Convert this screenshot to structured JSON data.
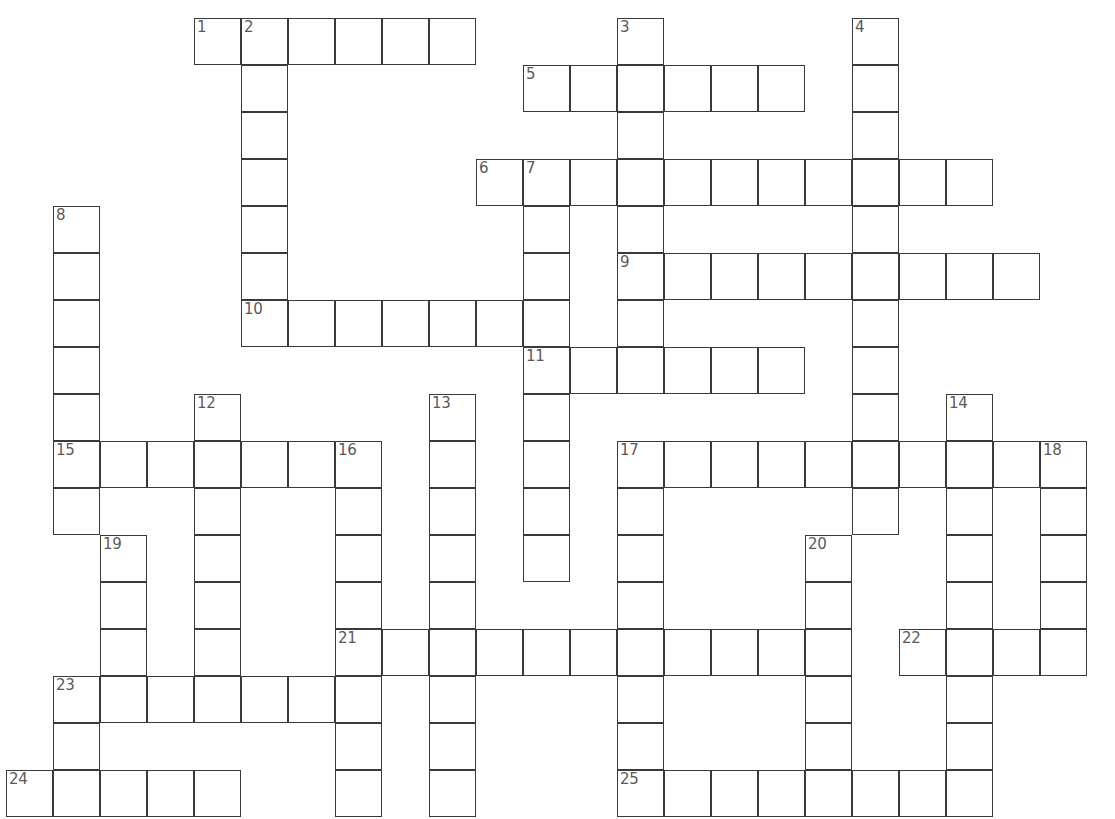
{
  "puzzle": {
    "title": "Crossword Puzzle Grid",
    "cell_size": 47,
    "origin_x": 6,
    "origin_y": 18,
    "cols": 23,
    "rows": 17,
    "colors": {
      "background": "#ffffff",
      "cell_fill": "#ffffff",
      "cell_border": "#3a3a3a",
      "number_text": "#5a5a5a"
    },
    "numbered_clue_count": 25,
    "clue_numbers": [
      1,
      2,
      3,
      4,
      5,
      6,
      7,
      8,
      9,
      10,
      11,
      12,
      13,
      14,
      15,
      16,
      17,
      18,
      19,
      20,
      21,
      22,
      23,
      24,
      25
    ],
    "entries": [
      {
        "number": "1",
        "direction": "across",
        "col": 4,
        "row": 0,
        "length": 6
      },
      {
        "number": "2",
        "direction": "down",
        "col": 5,
        "row": 0,
        "length": 7
      },
      {
        "number": "3",
        "direction": "down",
        "col": 13,
        "row": 0,
        "length": 8
      },
      {
        "number": "4",
        "direction": "down",
        "col": 18,
        "row": 0,
        "length": 10
      },
      {
        "number": "5",
        "direction": "across",
        "col": 11,
        "row": 1,
        "length": 6
      },
      {
        "number": "6",
        "direction": "across",
        "col": 10,
        "row": 3,
        "length": 11
      },
      {
        "number": "7",
        "direction": "down",
        "col": 11,
        "row": 3,
        "length": 9
      },
      {
        "number": "8",
        "direction": "down",
        "col": 1,
        "row": 4,
        "length": 7
      },
      {
        "number": "9",
        "direction": "across",
        "col": 13,
        "row": 5,
        "length": 9
      },
      {
        "number": "10",
        "direction": "across",
        "col": 5,
        "row": 6,
        "length": 7
      },
      {
        "number": "11",
        "direction": "across",
        "col": 11,
        "row": 7,
        "length": 6
      },
      {
        "number": "12",
        "direction": "down",
        "col": 4,
        "row": 8,
        "length": 9
      },
      {
        "number": "13",
        "direction": "down",
        "col": 9,
        "row": 8,
        "length": 9
      },
      {
        "number": "14",
        "direction": "down",
        "col": 20,
        "row": 8,
        "length": 8
      },
      {
        "number": "15",
        "direction": "across",
        "col": 1,
        "row": 9,
        "length": 7
      },
      {
        "number": "16",
        "direction": "down",
        "col": 7,
        "row": 9,
        "length": 8
      },
      {
        "number": "17",
        "direction": "across",
        "col": 13,
        "row": 9,
        "length": 9
      },
      {
        "number": "18",
        "direction": "down",
        "col": 22,
        "row": 9,
        "length": 6
      },
      {
        "number": "19",
        "direction": "down",
        "col": 2,
        "row": 11,
        "length": 5
      },
      {
        "number": "20",
        "direction": "down",
        "col": 17,
        "row": 11,
        "length": 6
      },
      {
        "number": "21",
        "direction": "across",
        "col": 7,
        "row": 13,
        "length": 10
      },
      {
        "number": "22",
        "direction": "across",
        "col": 19,
        "row": 13,
        "length": 4
      },
      {
        "number": "23",
        "direction": "across",
        "col": 1,
        "row": 14,
        "length": 7
      },
      {
        "number": "24",
        "direction": "across",
        "col": 0,
        "row": 16,
        "length": 5
      },
      {
        "number": "25",
        "direction": "across",
        "col": 13,
        "row": 16,
        "length": 8
      }
    ],
    "cells": [
      {
        "col": 4,
        "row": 0,
        "number": "1"
      },
      {
        "col": 5,
        "row": 0,
        "number": "2"
      },
      {
        "col": 6,
        "row": 0,
        "number": ""
      },
      {
        "col": 7,
        "row": 0,
        "number": ""
      },
      {
        "col": 8,
        "row": 0,
        "number": ""
      },
      {
        "col": 9,
        "row": 0,
        "number": ""
      },
      {
        "col": 13,
        "row": 0,
        "number": "3"
      },
      {
        "col": 18,
        "row": 0,
        "number": "4"
      },
      {
        "col": 5,
        "row": 1,
        "number": ""
      },
      {
        "col": 11,
        "row": 1,
        "number": "5"
      },
      {
        "col": 12,
        "row": 1,
        "number": ""
      },
      {
        "col": 13,
        "row": 1,
        "number": ""
      },
      {
        "col": 14,
        "row": 1,
        "number": ""
      },
      {
        "col": 15,
        "row": 1,
        "number": ""
      },
      {
        "col": 16,
        "row": 1,
        "number": ""
      },
      {
        "col": 18,
        "row": 1,
        "number": ""
      },
      {
        "col": 5,
        "row": 2,
        "number": ""
      },
      {
        "col": 13,
        "row": 2,
        "number": ""
      },
      {
        "col": 18,
        "row": 2,
        "number": ""
      },
      {
        "col": 5,
        "row": 3,
        "number": ""
      },
      {
        "col": 10,
        "row": 3,
        "number": "6"
      },
      {
        "col": 11,
        "row": 3,
        "number": "7"
      },
      {
        "col": 12,
        "row": 3,
        "number": ""
      },
      {
        "col": 13,
        "row": 3,
        "number": ""
      },
      {
        "col": 14,
        "row": 3,
        "number": ""
      },
      {
        "col": 15,
        "row": 3,
        "number": ""
      },
      {
        "col": 16,
        "row": 3,
        "number": ""
      },
      {
        "col": 17,
        "row": 3,
        "number": ""
      },
      {
        "col": 18,
        "row": 3,
        "number": ""
      },
      {
        "col": 19,
        "row": 3,
        "number": ""
      },
      {
        "col": 20,
        "row": 3,
        "number": ""
      },
      {
        "col": 1,
        "row": 4,
        "number": "8"
      },
      {
        "col": 5,
        "row": 4,
        "number": ""
      },
      {
        "col": 11,
        "row": 4,
        "number": ""
      },
      {
        "col": 13,
        "row": 4,
        "number": ""
      },
      {
        "col": 18,
        "row": 4,
        "number": ""
      },
      {
        "col": 1,
        "row": 5,
        "number": ""
      },
      {
        "col": 5,
        "row": 5,
        "number": ""
      },
      {
        "col": 11,
        "row": 5,
        "number": ""
      },
      {
        "col": 13,
        "row": 5,
        "number": "9"
      },
      {
        "col": 14,
        "row": 5,
        "number": ""
      },
      {
        "col": 15,
        "row": 5,
        "number": ""
      },
      {
        "col": 16,
        "row": 5,
        "number": ""
      },
      {
        "col": 17,
        "row": 5,
        "number": ""
      },
      {
        "col": 18,
        "row": 5,
        "number": ""
      },
      {
        "col": 19,
        "row": 5,
        "number": ""
      },
      {
        "col": 20,
        "row": 5,
        "number": ""
      },
      {
        "col": 21,
        "row": 5,
        "number": ""
      },
      {
        "col": 1,
        "row": 6,
        "number": ""
      },
      {
        "col": 5,
        "row": 6,
        "number": "10"
      },
      {
        "col": 6,
        "row": 6,
        "number": ""
      },
      {
        "col": 7,
        "row": 6,
        "number": ""
      },
      {
        "col": 8,
        "row": 6,
        "number": ""
      },
      {
        "col": 9,
        "row": 6,
        "number": ""
      },
      {
        "col": 10,
        "row": 6,
        "number": ""
      },
      {
        "col": 11,
        "row": 6,
        "number": ""
      },
      {
        "col": 13,
        "row": 6,
        "number": ""
      },
      {
        "col": 18,
        "row": 6,
        "number": ""
      },
      {
        "col": 1,
        "row": 7,
        "number": ""
      },
      {
        "col": 11,
        "row": 7,
        "number": "11"
      },
      {
        "col": 12,
        "row": 7,
        "number": ""
      },
      {
        "col": 13,
        "row": 7,
        "number": ""
      },
      {
        "col": 14,
        "row": 7,
        "number": ""
      },
      {
        "col": 15,
        "row": 7,
        "number": ""
      },
      {
        "col": 16,
        "row": 7,
        "number": ""
      },
      {
        "col": 18,
        "row": 7,
        "number": ""
      },
      {
        "col": 1,
        "row": 8,
        "number": ""
      },
      {
        "col": 4,
        "row": 8,
        "number": "12"
      },
      {
        "col": 9,
        "row": 8,
        "number": "13"
      },
      {
        "col": 11,
        "row": 8,
        "number": ""
      },
      {
        "col": 18,
        "row": 8,
        "number": ""
      },
      {
        "col": 20,
        "row": 8,
        "number": "14"
      },
      {
        "col": 1,
        "row": 9,
        "number": "15"
      },
      {
        "col": 2,
        "row": 9,
        "number": ""
      },
      {
        "col": 3,
        "row": 9,
        "number": ""
      },
      {
        "col": 4,
        "row": 9,
        "number": ""
      },
      {
        "col": 5,
        "row": 9,
        "number": ""
      },
      {
        "col": 6,
        "row": 9,
        "number": ""
      },
      {
        "col": 7,
        "row": 9,
        "number": "16"
      },
      {
        "col": 9,
        "row": 9,
        "number": ""
      },
      {
        "col": 11,
        "row": 9,
        "number": ""
      },
      {
        "col": 13,
        "row": 9,
        "number": "17"
      },
      {
        "col": 14,
        "row": 9,
        "number": ""
      },
      {
        "col": 15,
        "row": 9,
        "number": ""
      },
      {
        "col": 16,
        "row": 9,
        "number": ""
      },
      {
        "col": 17,
        "row": 9,
        "number": ""
      },
      {
        "col": 18,
        "row": 9,
        "number": ""
      },
      {
        "col": 19,
        "row": 9,
        "number": ""
      },
      {
        "col": 20,
        "row": 9,
        "number": ""
      },
      {
        "col": 21,
        "row": 9,
        "number": ""
      },
      {
        "col": 22,
        "row": 9,
        "number": "18"
      },
      {
        "col": 1,
        "row": 10,
        "number": ""
      },
      {
        "col": 4,
        "row": 10,
        "number": ""
      },
      {
        "col": 7,
        "row": 10,
        "number": ""
      },
      {
        "col": 9,
        "row": 10,
        "number": ""
      },
      {
        "col": 11,
        "row": 10,
        "number": ""
      },
      {
        "col": 13,
        "row": 10,
        "number": ""
      },
      {
        "col": 18,
        "row": 10,
        "number": ""
      },
      {
        "col": 20,
        "row": 10,
        "number": ""
      },
      {
        "col": 22,
        "row": 10,
        "number": ""
      },
      {
        "col": 2,
        "row": 11,
        "number": "19"
      },
      {
        "col": 4,
        "row": 11,
        "number": ""
      },
      {
        "col": 7,
        "row": 11,
        "number": ""
      },
      {
        "col": 9,
        "row": 11,
        "number": ""
      },
      {
        "col": 11,
        "row": 11,
        "number": ""
      },
      {
        "col": 13,
        "row": 11,
        "number": ""
      },
      {
        "col": 17,
        "row": 11,
        "number": "20"
      },
      {
        "col": 20,
        "row": 11,
        "number": ""
      },
      {
        "col": 22,
        "row": 11,
        "number": ""
      },
      {
        "col": 2,
        "row": 12,
        "number": ""
      },
      {
        "col": 4,
        "row": 12,
        "number": ""
      },
      {
        "col": 7,
        "row": 12,
        "number": ""
      },
      {
        "col": 9,
        "row": 12,
        "number": ""
      },
      {
        "col": 13,
        "row": 12,
        "number": ""
      },
      {
        "col": 17,
        "row": 12,
        "number": ""
      },
      {
        "col": 20,
        "row": 12,
        "number": ""
      },
      {
        "col": 22,
        "row": 12,
        "number": ""
      },
      {
        "col": 2,
        "row": 13,
        "number": ""
      },
      {
        "col": 4,
        "row": 13,
        "number": ""
      },
      {
        "col": 7,
        "row": 13,
        "number": "21"
      },
      {
        "col": 8,
        "row": 13,
        "number": ""
      },
      {
        "col": 9,
        "row": 13,
        "number": ""
      },
      {
        "col": 10,
        "row": 13,
        "number": ""
      },
      {
        "col": 11,
        "row": 13,
        "number": ""
      },
      {
        "col": 12,
        "row": 13,
        "number": ""
      },
      {
        "col": 13,
        "row": 13,
        "number": ""
      },
      {
        "col": 14,
        "row": 13,
        "number": ""
      },
      {
        "col": 15,
        "row": 13,
        "number": ""
      },
      {
        "col": 16,
        "row": 13,
        "number": ""
      },
      {
        "col": 17,
        "row": 13,
        "number": ""
      },
      {
        "col": 19,
        "row": 13,
        "number": "22"
      },
      {
        "col": 20,
        "row": 13,
        "number": ""
      },
      {
        "col": 21,
        "row": 13,
        "number": ""
      },
      {
        "col": 22,
        "row": 13,
        "number": ""
      },
      {
        "col": 1,
        "row": 14,
        "number": "23"
      },
      {
        "col": 2,
        "row": 14,
        "number": ""
      },
      {
        "col": 3,
        "row": 14,
        "number": ""
      },
      {
        "col": 4,
        "row": 14,
        "number": ""
      },
      {
        "col": 5,
        "row": 14,
        "number": ""
      },
      {
        "col": 6,
        "row": 14,
        "number": ""
      },
      {
        "col": 7,
        "row": 14,
        "number": ""
      },
      {
        "col": 9,
        "row": 14,
        "number": ""
      },
      {
        "col": 13,
        "row": 14,
        "number": ""
      },
      {
        "col": 17,
        "row": 14,
        "number": ""
      },
      {
        "col": 20,
        "row": 14,
        "number": ""
      },
      {
        "col": 1,
        "row": 15,
        "number": ""
      },
      {
        "col": 7,
        "row": 15,
        "number": ""
      },
      {
        "col": 9,
        "row": 15,
        "number": ""
      },
      {
        "col": 13,
        "row": 15,
        "number": ""
      },
      {
        "col": 17,
        "row": 15,
        "number": ""
      },
      {
        "col": 20,
        "row": 15,
        "number": ""
      },
      {
        "col": 0,
        "row": 16,
        "number": "24"
      },
      {
        "col": 1,
        "row": 16,
        "number": ""
      },
      {
        "col": 2,
        "row": 16,
        "number": ""
      },
      {
        "col": 3,
        "row": 16,
        "number": ""
      },
      {
        "col": 4,
        "row": 16,
        "number": ""
      },
      {
        "col": 7,
        "row": 16,
        "number": ""
      },
      {
        "col": 9,
        "row": 16,
        "number": ""
      },
      {
        "col": 13,
        "row": 16,
        "number": "25"
      },
      {
        "col": 14,
        "row": 16,
        "number": ""
      },
      {
        "col": 15,
        "row": 16,
        "number": ""
      },
      {
        "col": 16,
        "row": 16,
        "number": ""
      },
      {
        "col": 17,
        "row": 16,
        "number": ""
      },
      {
        "col": 18,
        "row": 16,
        "number": ""
      },
      {
        "col": 19,
        "row": 16,
        "number": ""
      },
      {
        "col": 20,
        "row": 16,
        "number": ""
      }
    ]
  }
}
